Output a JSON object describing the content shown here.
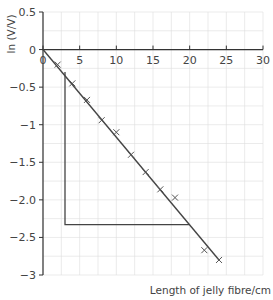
{
  "chart_data": {
    "type": "scatter",
    "title": "",
    "xlabel": "Length of jelly fibre/cm",
    "ylabel": "ln (V/V)",
    "xlim": [
      0,
      30
    ],
    "ylim": [
      -3,
      0.5
    ],
    "x_ticks": [
      0,
      5,
      10,
      15,
      20,
      25,
      30
    ],
    "x_tick_labels": [
      "0",
      "5",
      "10",
      "15",
      "20",
      "25",
      "30"
    ],
    "y_ticks": [
      0.5,
      0,
      -0.5,
      -1,
      -1.5,
      -2.0,
      -2.5,
      -3
    ],
    "y_tick_labels": [
      "0.5",
      "0",
      "−0.5",
      "−1",
      "−1.5",
      "−2.0",
      "−2.5",
      "−3"
    ],
    "grid": true,
    "grid_minor_x": 2.5,
    "grid_minor_y": 0.25,
    "series": [
      {
        "name": "measurements",
        "marker": "x",
        "x": [
          2,
          4,
          6,
          8,
          10,
          12,
          14,
          16,
          18,
          22,
          24
        ],
        "y": [
          -0.2,
          -0.45,
          -0.67,
          -0.94,
          -1.1,
          -1.4,
          -1.63,
          -1.86,
          -1.97,
          -2.67,
          -2.8
        ]
      }
    ],
    "best_fit_line": {
      "x": [
        0,
        24
      ],
      "y": [
        0,
        -2.8
      ]
    },
    "gradient_triangle": {
      "x": [
        3,
        3,
        20
      ],
      "y": [
        -0.3,
        -2.33,
        -2.33
      ]
    },
    "colors": {
      "line": "#444444",
      "grid": "#dddddd",
      "marker": "#555555",
      "axis": "#333333"
    }
  }
}
